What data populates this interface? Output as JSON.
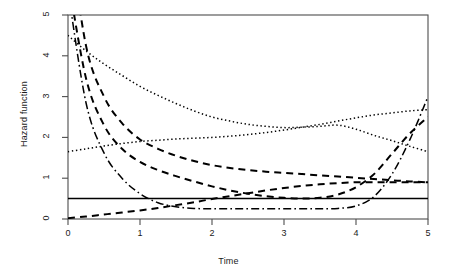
{
  "chart_data": {
    "type": "line",
    "title": "",
    "subtitle": "",
    "xlabel": "Time",
    "ylabel": "Hazard function",
    "xlim": [
      0,
      5
    ],
    "ylim": [
      0,
      5
    ],
    "xticks": [
      "0",
      "1",
      "2",
      "3",
      "4",
      "5"
    ],
    "yticks": [
      "0",
      "1",
      "2",
      "3",
      "4",
      "5"
    ],
    "xtick_values": [
      0,
      1,
      2,
      3,
      4,
      5
    ],
    "ytick_values": [
      0,
      1,
      2,
      3,
      4,
      5
    ],
    "grid": false,
    "legend": "none",
    "box": "full",
    "color": "#000000",
    "x": [
      0,
      0.25,
      0.5,
      0.75,
      1,
      1.25,
      1.5,
      1.75,
      2,
      2.25,
      2.5,
      2.75,
      3,
      3.25,
      3.5,
      3.75,
      4,
      4.25,
      4.5,
      4.75,
      5
    ],
    "series": [
      {
        "name": "constant-hazard",
        "linetype": "solid",
        "values": [
          0.5,
          0.5,
          0.5,
          0.5,
          0.5,
          0.5,
          0.5,
          0.5,
          0.5,
          0.5,
          0.5,
          0.5,
          0.5,
          0.5,
          0.5,
          0.5,
          0.5,
          0.5,
          0.5,
          0.5,
          0.5
        ]
      },
      {
        "name": "increasing-hazard",
        "linetype": "dashed",
        "values": [
          0.02,
          0.06,
          0.11,
          0.16,
          0.21,
          0.27,
          0.34,
          0.41,
          0.49,
          0.56,
          0.63,
          0.7,
          0.76,
          0.81,
          0.85,
          0.88,
          0.9,
          0.9,
          0.9,
          0.9,
          0.9
        ]
      },
      {
        "name": "decreasing-hazard-steep",
        "linetype": "dashed",
        "values": [
          7.2,
          4.25,
          3.0,
          2.35,
          1.95,
          1.72,
          1.55,
          1.42,
          1.32,
          1.25,
          1.2,
          1.16,
          1.13,
          1.1,
          1.07,
          1.04,
          1.01,
          0.98,
          0.95,
          0.92,
          0.9
        ]
      },
      {
        "name": "bathtub-hazard-dashed",
        "linetype": "dashed",
        "values": [
          5.9,
          3.45,
          2.3,
          1.72,
          1.4,
          1.2,
          1.05,
          0.92,
          0.8,
          0.7,
          0.62,
          0.56,
          0.52,
          0.5,
          0.52,
          0.6,
          0.78,
          1.1,
          1.6,
          2.1,
          2.5
        ]
      },
      {
        "name": "bathtub-hazard-dashdot",
        "linetype": "dashdot",
        "values": [
          5.6,
          2.85,
          1.62,
          1.0,
          0.62,
          0.4,
          0.3,
          0.26,
          0.25,
          0.25,
          0.25,
          0.25,
          0.25,
          0.25,
          0.25,
          0.26,
          0.32,
          0.55,
          1.1,
          1.95,
          3.0
        ]
      },
      {
        "name": "decreasing-hazard-dotted",
        "linetype": "dotted",
        "values": [
          4.5,
          4.12,
          3.8,
          3.52,
          3.25,
          3.03,
          2.83,
          2.65,
          2.5,
          2.4,
          2.32,
          2.27,
          2.24,
          2.25,
          2.27,
          2.3,
          2.2,
          2.05,
          1.92,
          1.78,
          1.65
        ]
      },
      {
        "name": "increasing-hazard-dotted",
        "linetype": "dotted",
        "values": [
          1.65,
          1.72,
          1.79,
          1.85,
          1.9,
          1.93,
          1.96,
          1.98,
          2.0,
          2.03,
          2.07,
          2.12,
          2.18,
          2.25,
          2.32,
          2.4,
          2.48,
          2.55,
          2.6,
          2.65,
          2.68
        ]
      }
    ]
  },
  "axes": {
    "xlabel": "Time",
    "ylabel": "Hazard function",
    "xticks": [
      {
        "label": "0"
      },
      {
        "label": "1"
      },
      {
        "label": "2"
      },
      {
        "label": "3"
      },
      {
        "label": "4"
      },
      {
        "label": "5"
      }
    ],
    "yticks": [
      {
        "label": "0"
      },
      {
        "label": "1"
      },
      {
        "label": "2"
      },
      {
        "label": "3"
      },
      {
        "label": "4"
      },
      {
        "label": "5"
      }
    ]
  }
}
